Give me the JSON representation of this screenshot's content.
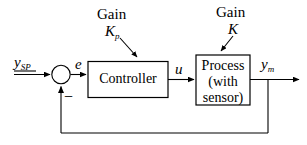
{
  "diagram": {
    "stroke_color": "#000000",
    "background_color": "#ffffff",
    "annotations": {
      "controller_gain": {
        "word": "Gain",
        "symbol": "K",
        "subscript": "p"
      },
      "process_gain": {
        "word": "Gain",
        "symbol": "K",
        "subscript": ""
      }
    },
    "blocks": [
      {
        "id": "controller",
        "lines": [
          "Controller"
        ]
      },
      {
        "id": "process",
        "lines": [
          "Process",
          "(with",
          "sensor)"
        ]
      }
    ],
    "signals": {
      "setpoint": {
        "symbol": "y",
        "subscript": "SP"
      },
      "error": {
        "symbol": "e",
        "subscript": ""
      },
      "control": {
        "symbol": "u",
        "subscript": ""
      },
      "measured": {
        "symbol": "y",
        "subscript": "m"
      }
    },
    "summing_junction": {
      "sign": "−"
    }
  }
}
